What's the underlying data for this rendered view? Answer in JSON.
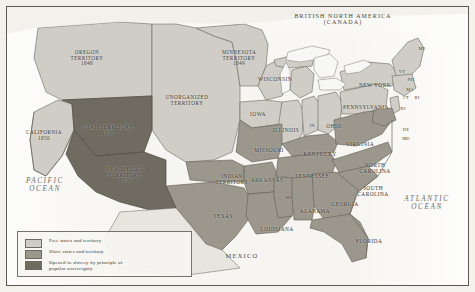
{
  "figure": {
    "background_color": "#f3f1ec",
    "frame_color": "#5d5a52"
  },
  "colors": {
    "free": "#cfcdc5",
    "slave": "#9b978c",
    "popular_sovereignty": "#6f6b61",
    "water": "#ffffff",
    "outline": "#6b6860",
    "text": "#3a382f"
  },
  "legend": {
    "items": [
      {
        "swatch": "free",
        "label": "Free states and territory"
      },
      {
        "swatch": "slave",
        "label": "Slave states and territory"
      },
      {
        "swatch": "popular_sovereignty",
        "label": "Opened to slavery by principle of\npopular sovereignty"
      }
    ]
  },
  "oceans": [
    {
      "name": "pacific-ocean-label",
      "label": "PACIFIC\nOCEAN",
      "x": 14,
      "y": 178
    },
    {
      "name": "atlantic-ocean-label",
      "label": "ATLANTIC\nOCEAN",
      "x": 392,
      "y": 196
    }
  ],
  "countries": [
    {
      "name": "british-north-america-label",
      "label": "BRITISH NORTH AMERICA\n(CANADA)",
      "x": 287,
      "y": 13,
      "cls": "country"
    },
    {
      "name": "mexico-label",
      "label": "MEXICO",
      "x": 212,
      "y": 253,
      "cls": "mexico"
    }
  ],
  "regions": [
    {
      "name": "oregon-territory-label",
      "label": "OREGON\nTERRITORY\n1848",
      "x": 59,
      "y": 50,
      "cls": "terr"
    },
    {
      "name": "utah-territory-label",
      "label": "UTAH TERRITORY\n1850",
      "x": 72,
      "y": 125,
      "cls": "terr"
    },
    {
      "name": "california-label",
      "label": "CALIFORNIA\n1850",
      "x": 18,
      "y": 130,
      "cls": "terr"
    },
    {
      "name": "new-mexico-territory-label",
      "label": "NEW MEXICO\nTERRITORY\n1850",
      "x": 95,
      "y": 167,
      "cls": "terr"
    },
    {
      "name": "minnesota-territory-label",
      "label": "MINNESOTA\nTERRITORY\n1849",
      "x": 210,
      "y": 50,
      "cls": "terr"
    },
    {
      "name": "unorganized-territory-label",
      "label": "UNORGANIZED\nTERRITORY",
      "x": 152,
      "y": 95,
      "cls": "terr"
    },
    {
      "name": "indian-territory-label",
      "label": "INDIAN\nTERRITORY",
      "x": 208,
      "y": 174,
      "cls": "terr"
    }
  ],
  "states": [
    {
      "name": "state-label-wisconsin",
      "label": "WISCONSIN",
      "x": 253,
      "y": 77,
      "cls": "st"
    },
    {
      "name": "state-label-iowa",
      "label": "IOWA",
      "x": 245,
      "y": 112,
      "cls": "st"
    },
    {
      "name": "state-label-illinois",
      "label": "ILLINOIS",
      "x": 268,
      "y": 128,
      "cls": "st"
    },
    {
      "name": "state-label-indiana",
      "label": "IN",
      "x": 306,
      "y": 124,
      "cls": "sm"
    },
    {
      "name": "state-label-ohio",
      "label": "OHIO",
      "x": 322,
      "y": 124,
      "cls": "st"
    },
    {
      "name": "state-label-missouri",
      "label": "MISSOURI",
      "x": 250,
      "y": 148,
      "cls": "st"
    },
    {
      "name": "state-label-kentucky",
      "label": "KENTUCKY",
      "x": 300,
      "y": 152,
      "cls": "st"
    },
    {
      "name": "state-label-arkansas",
      "label": "ARKANSAS",
      "x": 247,
      "y": 178,
      "cls": "st"
    },
    {
      "name": "state-label-tennessee",
      "label": "TENNESSEE",
      "x": 290,
      "y": 174,
      "cls": "st"
    },
    {
      "name": "state-label-mississippi",
      "label": "MS",
      "x": 283,
      "y": 196,
      "cls": "sm"
    },
    {
      "name": "state-label-alabama",
      "label": "ALABAMA",
      "x": 296,
      "y": 209,
      "cls": "st"
    },
    {
      "name": "state-label-georgia",
      "label": "GEORGIA",
      "x": 327,
      "y": 202,
      "cls": "st"
    },
    {
      "name": "state-label-north-carolina",
      "label": "NORTH\nCAROLINA",
      "x": 355,
      "y": 163,
      "cls": "st"
    },
    {
      "name": "state-label-south-carolina",
      "label": "SOUTH\nCAROLINA",
      "x": 353,
      "y": 186,
      "cls": "st"
    },
    {
      "name": "state-label-virginia",
      "label": "VIRGINIA",
      "x": 341,
      "y": 142,
      "cls": "st"
    },
    {
      "name": "state-label-texas",
      "label": "TEXAS",
      "x": 208,
      "y": 214,
      "cls": "st"
    },
    {
      "name": "state-label-louisiana",
      "label": "LOUISIANA",
      "x": 256,
      "y": 227,
      "cls": "st"
    },
    {
      "name": "state-label-florida",
      "label": "FLORIDA",
      "x": 352,
      "y": 239,
      "cls": "st"
    },
    {
      "name": "state-label-pennsylvania",
      "label": "PENNSYLVANIA",
      "x": 340,
      "y": 105,
      "cls": "st"
    },
    {
      "name": "state-label-new-york",
      "label": "NEW YORK",
      "x": 355,
      "y": 83,
      "cls": "st"
    },
    {
      "name": "state-label-maine",
      "label": "ME",
      "x": 416,
      "y": 47,
      "cls": "sm"
    },
    {
      "name": "state-label-vermont",
      "label": "VT",
      "x": 396,
      "y": 70,
      "cls": "sm"
    },
    {
      "name": "state-label-new-hampshire",
      "label": "NH",
      "x": 405,
      "y": 78,
      "cls": "sm"
    },
    {
      "name": "state-label-massachusetts",
      "label": "MA",
      "x": 404,
      "y": 88,
      "cls": "sm"
    },
    {
      "name": "state-label-connecticut",
      "label": "CT",
      "x": 401,
      "y": 96,
      "cls": "sm"
    },
    {
      "name": "state-label-rhode-island",
      "label": "RI",
      "x": 412,
      "y": 96,
      "cls": "sm"
    },
    {
      "name": "state-label-new-jersey",
      "label": "NJ",
      "x": 397,
      "y": 107,
      "cls": "sm"
    },
    {
      "name": "state-label-delaware",
      "label": "DE",
      "x": 400,
      "y": 128,
      "cls": "sm"
    },
    {
      "name": "state-label-maryland",
      "label": "MD",
      "x": 400,
      "y": 137,
      "cls": "sm"
    }
  ]
}
